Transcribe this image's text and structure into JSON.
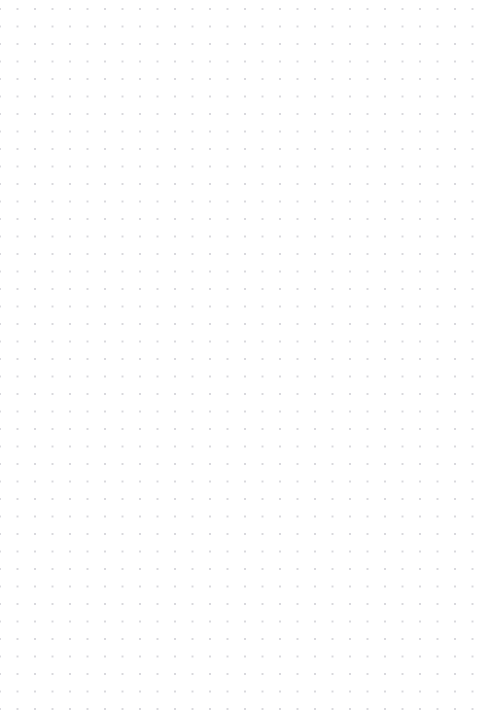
{
  "page": {
    "kind": "dot-grid-page",
    "title": "",
    "width": 479,
    "height": 713,
    "background_color": "#ffffff",
    "content_text": "",
    "notes": ""
  },
  "grid": {
    "pattern": "dot-grid",
    "dot_color": "#d8d8dd",
    "dot_radius_px": 0.75,
    "spacing_x_px": 17.5,
    "spacing_y_px": 17.5,
    "offset_x_px": 0,
    "offset_y_px": 9,
    "columns": 28,
    "rows": 41,
    "visible": true
  },
  "chart_data": {
    "type": "scatter",
    "title": "",
    "xlabel": "",
    "ylabel": "",
    "grid": true,
    "legend": null,
    "xlim": [
      0,
      479
    ],
    "ylim": [
      0,
      713
    ],
    "series": [
      {
        "name": "grid-dots",
        "spacing_x": 17.5,
        "spacing_y": 17.5,
        "origin_x": 0,
        "origin_y": 9,
        "count_x": 28,
        "count_y": 41,
        "color": "#d8d8dd",
        "values": []
      }
    ]
  }
}
